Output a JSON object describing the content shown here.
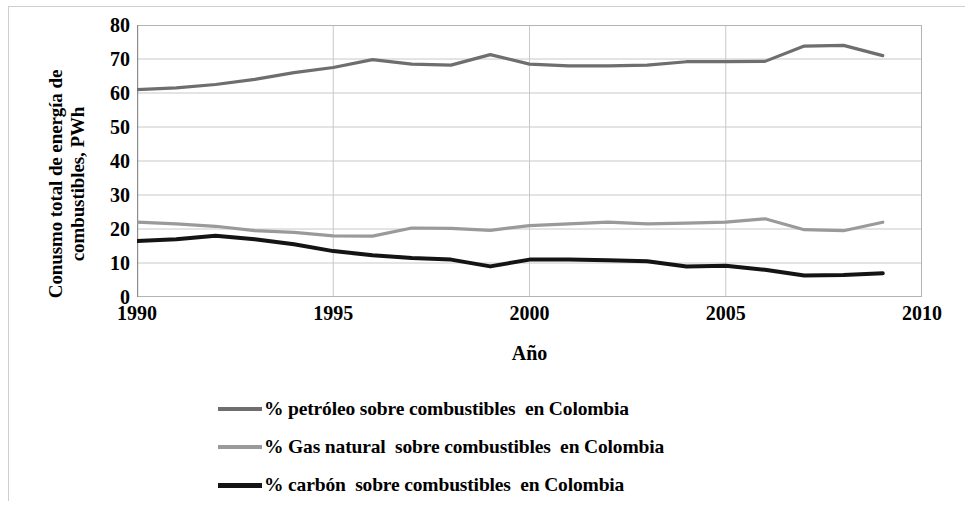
{
  "axes": {
    "y_title": "Conusmo total de energía de combustibles, PWh",
    "y_title_line1": "Conusmo total de energía de",
    "y_title_line2": "combustibles, PWh",
    "x_title": "Año"
  },
  "legend": {
    "items": [
      {
        "label": "% petróleo sobre combustibles  en Colombia",
        "color": "#6e6e6e",
        "key": "oil"
      },
      {
        "label": "% Gas natural  sobre combustibles  en Colombia",
        "color": "#9a9a9a",
        "key": "gas"
      },
      {
        "label": "% carbón  sobre combustibles  en Colombia",
        "color": "#141414",
        "key": "coal"
      }
    ]
  },
  "chart_data": {
    "type": "line",
    "title": "",
    "xlabel": "Año",
    "ylabel": "Conusmo total de energía de combustibles, PWh",
    "xlim": [
      1990,
      2010
    ],
    "ylim": [
      0,
      80
    ],
    "xticks": [
      1990,
      1995,
      2000,
      2005,
      2010
    ],
    "yticks": [
      0,
      10,
      20,
      30,
      40,
      50,
      60,
      70,
      80
    ],
    "grid": true,
    "legend_position": "bottom",
    "x": [
      1990,
      1991,
      1992,
      1993,
      1994,
      1995,
      1996,
      1997,
      1998,
      1999,
      2000,
      2001,
      2002,
      2003,
      2004,
      2005,
      2006,
      2007,
      2008,
      2009
    ],
    "series": [
      {
        "name": "% petróleo sobre combustibles  en Colombia",
        "color": "#6e6e6e",
        "width": 3.2,
        "values": [
          61.0,
          61.5,
          62.5,
          64.0,
          66.0,
          67.5,
          69.8,
          68.5,
          68.2,
          71.3,
          68.5,
          68.0,
          68.0,
          68.2,
          69.2,
          69.2,
          69.3,
          73.8,
          74.0,
          71.0
        ]
      },
      {
        "name": "% Gas natural  sobre combustibles  en Colombia",
        "color": "#9a9a9a",
        "width": 3.2,
        "values": [
          22.0,
          21.5,
          20.8,
          19.5,
          19.0,
          18.0,
          17.9,
          20.3,
          20.2,
          19.6,
          21.0,
          21.5,
          22.0,
          21.5,
          21.7,
          22.0,
          23.0,
          19.8,
          19.5,
          22.0
        ]
      },
      {
        "name": "% carbón  sobre combustibles  en Colombia",
        "color": "#141414",
        "width": 4.0,
        "values": [
          16.5,
          17.0,
          18.0,
          17.0,
          15.5,
          13.5,
          12.3,
          11.5,
          11.0,
          9.0,
          11.0,
          11.0,
          10.8,
          10.5,
          9.0,
          9.2,
          8.0,
          6.3,
          6.5,
          7.0
        ]
      }
    ]
  }
}
